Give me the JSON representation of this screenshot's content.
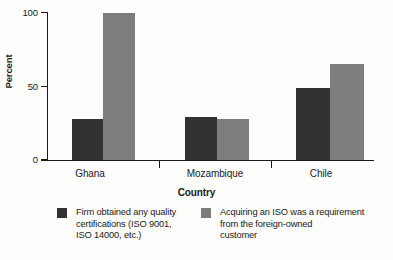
{
  "chart_data": {
    "type": "bar",
    "title": "",
    "subtitle": "",
    "xlabel": "Country",
    "ylabel": "Percent",
    "categories": [
      "Ghana",
      "Mozambique",
      "Chile"
    ],
    "series": [
      {
        "name": "Firm obtained any quality certifications (ISO 9001, ISO 14000, etc.)",
        "color": "#333231",
        "values": [
          28,
          29,
          49
        ]
      },
      {
        "name": "Acquiring an ISO was a requirement from the foreign-owned customer",
        "color": "#7e7d7b",
        "values": [
          100,
          28,
          65
        ]
      }
    ],
    "ylim": [
      0,
      100
    ],
    "yticks": [
      0,
      50,
      100
    ],
    "ytick_labels": [
      "0",
      "50",
      "100"
    ],
    "grid": false,
    "legend_position": "bottom"
  },
  "axes": {
    "y_title": "Percent",
    "x_title": "Country",
    "y_tick_labels": [
      "100",
      "50",
      "0"
    ],
    "x_tick_labels": [
      "Ghana",
      "Mozambique",
      "Chile"
    ]
  },
  "legend": {
    "entries": [
      {
        "label": "Firm obtained any quality\ncertifications (ISO 9001,\nISO 14000, etc.)",
        "color": "#333231"
      },
      {
        "label": "Acquiring an ISO was a requirement\nfrom the foreign-owned\ncustomer",
        "color": "#7e7d7b"
      }
    ]
  },
  "colors": {
    "series_dark": "#333231",
    "series_light": "#7e7d7b",
    "axis": "#1a1a1a",
    "background": "#fdfdfc"
  }
}
